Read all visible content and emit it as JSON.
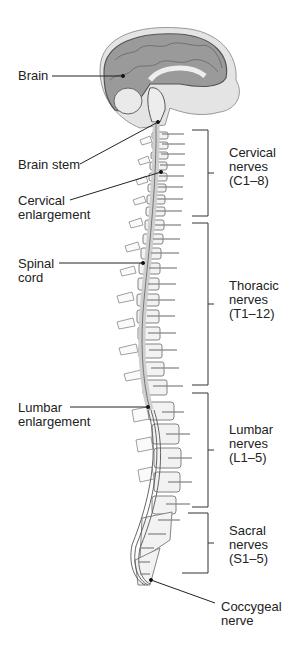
{
  "diagram": {
    "left_labels": [
      {
        "id": "brain",
        "text": "Brain"
      },
      {
        "id": "brain-stem",
        "text": "Brain stem"
      },
      {
        "id": "cervical-enlargement",
        "text": "Cervical\nenlargement"
      },
      {
        "id": "spinal-cord",
        "text": "Spinal\ncord"
      },
      {
        "id": "lumbar-enlargement",
        "text": "Lumbar\nenlargement"
      }
    ],
    "right_labels": [
      {
        "id": "cervical-nerves",
        "text": "Cervical\nnerves\n(C1–8)"
      },
      {
        "id": "thoracic-nerves",
        "text": "Thoracic\nnerves\n(T1–12)"
      },
      {
        "id": "lumbar-nerves",
        "text": "Lumbar\nnerves\n(L1–5)"
      },
      {
        "id": "sacral-nerves",
        "text": "Sacral\nnerves\n(S1–5)"
      },
      {
        "id": "coccygeal-nerve",
        "text": "Coccygeal\nnerve"
      }
    ]
  }
}
